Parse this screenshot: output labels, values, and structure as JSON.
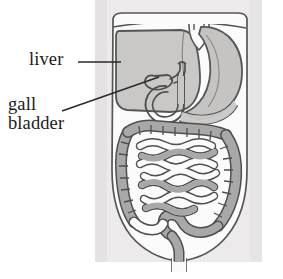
{
  "figure": {
    "type": "anatomical-line-drawing",
    "background_color": "#ffffff",
    "panel_color": "#eceaea",
    "panel": {
      "x": 95,
      "y": 0,
      "width": 167,
      "height": 262
    }
  },
  "labels": {
    "liver": {
      "text": "liver",
      "x": 29,
      "y": 50,
      "leader": {
        "type": "straight-horizontal",
        "x1": 78,
        "y1": 62,
        "x2": 121,
        "y2": 62
      }
    },
    "gall_bladder": {
      "line1": "gall",
      "line2": "bladder",
      "x": 8,
      "y": 95,
      "leader": {
        "type": "straight-diagonal",
        "x1": 62,
        "y1": 111,
        "x2": 159,
        "y2": 77
      }
    }
  },
  "colors": {
    "ink": "#565656",
    "ink_dark": "#4a4a4a",
    "text": "#1b1b1b",
    "liver_fill": "#c9c8c7",
    "stomach_fill": "#c5c4c3",
    "intestine_fill": "#a9a8a7",
    "body_fill": "#fbfbfb",
    "panel_bg": "#eceaea",
    "page_bg": "#ffffff"
  },
  "organs": [
    {
      "name": "liver",
      "fill": "#c9c8c7",
      "region": "upper-left"
    },
    {
      "name": "stomach",
      "fill": "#c5c4c3",
      "region": "upper-right"
    },
    {
      "name": "gall-bladder",
      "fill": "#c9c8c7",
      "region": "center"
    },
    {
      "name": "duodenum",
      "fill": "#c9c8c7",
      "region": "center"
    },
    {
      "name": "large-intestine-colon",
      "fill": "#a9a8a7",
      "region": "lower-perimeter"
    },
    {
      "name": "small-intestine",
      "fill": "#fbfbfb",
      "region": "lower-center"
    },
    {
      "name": "rectum",
      "fill": "#a9a8a7",
      "region": "bottom-center"
    },
    {
      "name": "torso-outline",
      "fill": "#fbfbfb",
      "region": "whole"
    },
    {
      "name": "diaphragm",
      "fill": "none",
      "region": "top"
    }
  ]
}
